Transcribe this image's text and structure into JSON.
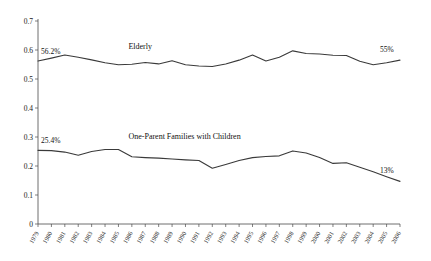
{
  "partial_title": "",
  "chart_data": {
    "type": "line",
    "title": "",
    "xlabel": "",
    "ylabel": "",
    "grid": false,
    "legend_position": "inline-annotation",
    "x": [
      1979,
      1980,
      1981,
      1982,
      1983,
      1984,
      1985,
      1986,
      1987,
      1988,
      1989,
      1990,
      1991,
      1992,
      1993,
      1994,
      1995,
      1996,
      1997,
      1998,
      1999,
      2000,
      2001,
      2002,
      2003,
      2004,
      2005,
      2006
    ],
    "categories": [
      "1979",
      "1980",
      "1981",
      "1982",
      "1983",
      "1984",
      "1985",
      "1986",
      "1987",
      "1988",
      "1989",
      "1990",
      "1991",
      "1992",
      "1993",
      "1994",
      "1995",
      "1996",
      "1997",
      "1998",
      "1999",
      "2000",
      "2001",
      "2002",
      "2003",
      "2004",
      "2005",
      "2006"
    ],
    "ylim": [
      0,
      0.7
    ],
    "yticks": [
      0,
      0.1,
      0.2,
      0.3,
      0.4,
      0.5,
      0.6,
      0.7
    ],
    "ytick_labels": [
      "0",
      "0.1",
      "0.2",
      "0.3",
      "0.4",
      "0.5",
      "0.6",
      "0.7"
    ],
    "series": [
      {
        "name": "Elderly",
        "color": "#3a3a3a",
        "label_x_index": 6,
        "start_label": "56.2%",
        "end_label": "55%",
        "values": [
          0.562,
          0.572,
          0.583,
          0.575,
          0.566,
          0.556,
          0.549,
          0.551,
          0.557,
          0.552,
          0.563,
          0.549,
          0.545,
          0.543,
          0.552,
          0.565,
          0.583,
          0.562,
          0.575,
          0.597,
          0.588,
          0.586,
          0.582,
          0.581,
          0.561,
          0.549,
          0.556,
          0.565
        ]
      },
      {
        "name": "One-Parent Families with Children",
        "color": "#3a3a3a",
        "label_x_index": 6,
        "start_label": "25.4%",
        "end_label": "13%",
        "values": [
          0.254,
          0.253,
          0.248,
          0.237,
          0.25,
          0.257,
          0.257,
          0.232,
          0.229,
          0.227,
          0.224,
          0.221,
          0.219,
          0.192,
          0.205,
          0.219,
          0.229,
          0.233,
          0.235,
          0.252,
          0.245,
          0.229,
          0.209,
          0.211,
          0.196,
          0.18,
          0.163,
          0.147
        ]
      }
    ],
    "series_tail": [
      {
        "name": "Elderly",
        "values_continued": [
          0.592,
          0.594,
          0.59,
          0.575,
          0.551
        ]
      },
      {
        "name": "One-Parent Families with Children",
        "values_continued": [
          0.13,
          0.122,
          0.118,
          0.133,
          0.131
        ]
      }
    ],
    "elderly_full": [
      0.562,
      0.572,
      0.583,
      0.575,
      0.566,
      0.556,
      0.549,
      0.551,
      0.557,
      0.552,
      0.563,
      0.549,
      0.545,
      0.543,
      0.552,
      0.565,
      0.583,
      0.562,
      0.575,
      0.597,
      0.588,
      0.586,
      0.582,
      0.581,
      0.561,
      0.549,
      0.556,
      0.565
    ],
    "oneparent_full": [
      0.254,
      0.253,
      0.248,
      0.237,
      0.25,
      0.257,
      0.257,
      0.232,
      0.229,
      0.227,
      0.224,
      0.221,
      0.219,
      0.192,
      0.205,
      0.219,
      0.229,
      0.233,
      0.235,
      0.252,
      0.245,
      0.229,
      0.209,
      0.211,
      0.196,
      0.18,
      0.163,
      0.147
    ]
  },
  "annotations": {
    "elderly_name": "Elderly",
    "elderly_start": "56.2%",
    "elderly_end": "55%",
    "oneparent_name": "One-Parent Families with Children",
    "oneparent_start": "25.4%",
    "oneparent_end": "13%"
  }
}
